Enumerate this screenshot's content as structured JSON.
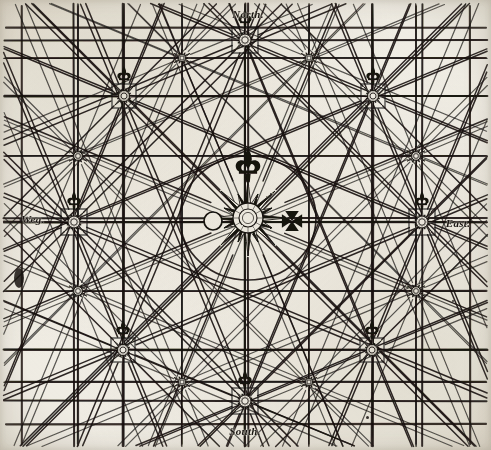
{
  "document": {
    "title": "Compass Rose Rhumb-Line Chart",
    "kind": "portolan-style wind rose diagram",
    "paper_color": "#f4f2ec",
    "ink_color": "#171310"
  },
  "cardinals": [
    {
      "id": "north",
      "label": "North.",
      "x": 248,
      "y": 14
    },
    {
      "id": "west",
      "label": "Weg.",
      "x": 33,
      "y": 219
    },
    {
      "id": "east",
      "label": "East.",
      "x": 458,
      "y": 223
    },
    {
      "id": "south",
      "label": "South.",
      "x": 245,
      "y": 431
    }
  ],
  "center_rose": {
    "name": "central-compass-rose",
    "cx": 248,
    "cy": 218,
    "points": 16,
    "long_ray": 38,
    "short_ray": 26,
    "hub_outer": 15,
    "hub_inner": 9,
    "circle_radius": 62,
    "fleur_y": 168
  },
  "flanking_symbols": {
    "left": {
      "name": "sun-circle-symbol",
      "cx": 213,
      "cy": 221,
      "r": 9
    },
    "right": {
      "name": "maltese-cross-symbol",
      "cx": 292,
      "cy": 221,
      "size": 11
    }
  },
  "major_roses": [
    {
      "id": "rose-north",
      "cx": 245,
      "cy": 40,
      "r": 12,
      "fleur": true
    },
    {
      "id": "rose-northwest",
      "cx": 124,
      "cy": 96,
      "r": 11,
      "fleur": true
    },
    {
      "id": "rose-northeast",
      "cx": 373,
      "cy": 96,
      "r": 11,
      "fleur": true
    },
    {
      "id": "rose-west",
      "cx": 74,
      "cy": 222,
      "r": 12,
      "fleur": true
    },
    {
      "id": "rose-east",
      "cx": 422,
      "cy": 222,
      "r": 12,
      "fleur": true
    },
    {
      "id": "rose-southwest",
      "cx": 123,
      "cy": 350,
      "r": 11,
      "fleur": true
    },
    {
      "id": "rose-southeast",
      "cx": 372,
      "cy": 350,
      "r": 11,
      "fleur": true
    },
    {
      "id": "rose-south",
      "cx": 245,
      "cy": 401,
      "r": 12,
      "fleur": true
    }
  ],
  "minor_nodes": [
    {
      "id": "node-nw-inner",
      "cx": 78,
      "cy": 156,
      "r": 7
    },
    {
      "id": "node-ne-inner",
      "cx": 416,
      "cy": 156,
      "r": 7
    },
    {
      "id": "node-sw-inner",
      "cx": 78,
      "cy": 291,
      "r": 7
    },
    {
      "id": "node-se-inner",
      "cx": 416,
      "cy": 291,
      "r": 7
    },
    {
      "id": "node-n-inner",
      "cx": 182,
      "cy": 58,
      "r": 6
    },
    {
      "id": "node-n2-inner",
      "cx": 309,
      "cy": 58,
      "r": 6
    },
    {
      "id": "node-s-inner",
      "cx": 182,
      "cy": 382,
      "r": 6
    },
    {
      "id": "node-s2-inner",
      "cx": 309,
      "cy": 382,
      "r": 6
    }
  ],
  "grid": {
    "name": "rectangular-grid",
    "vertical_x": [
      22,
      78,
      182,
      309,
      416,
      470
    ],
    "horizontal_y": [
      28,
      58,
      156,
      291,
      382,
      424
    ],
    "stroke": "#2b2420",
    "stroke_width": 1.6
  },
  "blemishes": [
    {
      "id": "ink-blot-left-edge",
      "x": 14,
      "y": 268,
      "w": 10,
      "h": 20
    },
    {
      "id": "speck-bottom-right",
      "x": 366,
      "y": 416,
      "w": 3,
      "h": 3
    },
    {
      "id": "speck-mid-right",
      "x": 452,
      "y": 300,
      "w": 2,
      "h": 2
    }
  ],
  "chart_data": {
    "type": "diagram",
    "node_count": 17,
    "rhumb_lines_per_rose": 16,
    "cardinal_labels": [
      "North.",
      "Weg.",
      "East.",
      "South."
    ],
    "grid_lines": {
      "vertical": 6,
      "horizontal": 6
    },
    "legend_position": "none",
    "axis_ranges": {
      "x": [
        0,
        491
      ],
      "y": [
        0,
        450
      ]
    }
  }
}
